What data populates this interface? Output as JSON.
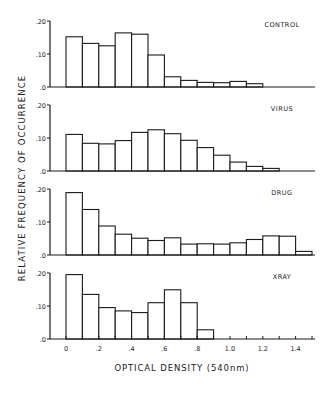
{
  "chart_data": {
    "type": "bar",
    "subtype": "histogram-small-multiples",
    "xlabel": "OPTICAL DENSITY (540nm)",
    "ylabel": "RELATIVE FREQUENCY OF OCCURRENCE",
    "xlim": [
      0,
      1.5
    ],
    "ylim": [
      0,
      0.2
    ],
    "bin_width": 0.1,
    "x_tick_labels": [
      "0",
      ".2",
      ".4",
      ".6",
      ".8",
      "1.0",
      "1.2",
      "1.4"
    ],
    "x_tick_values": [
      0,
      0.2,
      0.4,
      0.6,
      0.8,
      1.0,
      1.2,
      1.4
    ],
    "y_tick_labels": [
      ".20",
      ".10",
      ".0"
    ],
    "y_tick_values": [
      0.2,
      0.1,
      0.0
    ],
    "grid": false,
    "panels": [
      {
        "name": "CONTROL",
        "bin_starts": [
          0,
          0.1,
          0.2,
          0.3,
          0.4,
          0.5,
          0.6,
          0.7,
          0.8,
          0.9,
          1.0,
          1.1
        ],
        "values": [
          0.152,
          0.132,
          0.125,
          0.164,
          0.16,
          0.097,
          0.031,
          0.02,
          0.014,
          0.013,
          0.017,
          0.01
        ]
      },
      {
        "name": "VIRUS",
        "bin_starts": [
          0,
          0.1,
          0.2,
          0.3,
          0.4,
          0.5,
          0.6,
          0.7,
          0.8,
          0.9,
          1.0,
          1.1,
          1.2
        ],
        "values": [
          0.111,
          0.084,
          0.082,
          0.092,
          0.117,
          0.125,
          0.113,
          0.093,
          0.071,
          0.048,
          0.027,
          0.014,
          0.008
        ]
      },
      {
        "name": "DRUG",
        "bin_starts": [
          0,
          0.1,
          0.2,
          0.3,
          0.4,
          0.5,
          0.6,
          0.7,
          0.8,
          0.9,
          1.0,
          1.1,
          1.2,
          1.3,
          1.4
        ],
        "values": [
          0.189,
          0.138,
          0.088,
          0.063,
          0.051,
          0.044,
          0.052,
          0.033,
          0.034,
          0.033,
          0.037,
          0.047,
          0.058,
          0.057,
          0.011
        ]
      },
      {
        "name": "XRAY",
        "bin_starts": [
          0,
          0.1,
          0.2,
          0.3,
          0.4,
          0.5,
          0.6,
          0.7,
          0.8
        ],
        "values": [
          0.195,
          0.135,
          0.095,
          0.085,
          0.08,
          0.11,
          0.149,
          0.11,
          0.028
        ]
      }
    ]
  },
  "layout_hints": {
    "panel_baselines_px": [
      87,
      171,
      255,
      339
    ],
    "px_per_unit_y": 330,
    "x_origin_px": 66,
    "px_per_unit_x": 164,
    "y_axis_x_px": 50,
    "x_axis_end_px": 315
  },
  "colors": {
    "ink": "#1a1a1a",
    "bar_fill": "#ffffff",
    "background": "#ffffff"
  }
}
